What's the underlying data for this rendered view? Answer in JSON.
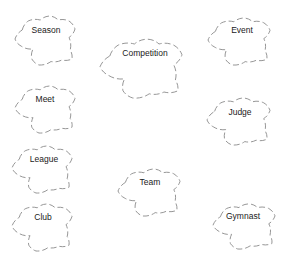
{
  "diagram": {
    "type": "concept-clouds",
    "stroke_color": "#8a8a8a",
    "text_color": "#1a1a1a",
    "nodes": [
      {
        "id": "season",
        "label": "Season",
        "x": 15,
        "y": 15,
        "w": 60,
        "h": 50,
        "tx": 46,
        "ty": 30
      },
      {
        "id": "competition",
        "label": "Competition",
        "x": 100,
        "y": 38,
        "w": 82,
        "h": 60,
        "tx": 145,
        "ty": 53
      },
      {
        "id": "event",
        "label": "Event",
        "x": 208,
        "y": 17,
        "w": 62,
        "h": 48,
        "tx": 242,
        "ty": 30
      },
      {
        "id": "meet",
        "label": "Meet",
        "x": 15,
        "y": 85,
        "w": 60,
        "h": 48,
        "tx": 45,
        "ty": 99
      },
      {
        "id": "judge",
        "label": "Judge",
        "x": 207,
        "y": 97,
        "w": 63,
        "h": 48,
        "tx": 240,
        "ty": 112
      },
      {
        "id": "league",
        "label": "League",
        "x": 12,
        "y": 145,
        "w": 60,
        "h": 48,
        "tx": 44,
        "ty": 159
      },
      {
        "id": "team",
        "label": "Team",
        "x": 118,
        "y": 168,
        "w": 62,
        "h": 48,
        "tx": 150,
        "ty": 182
      },
      {
        "id": "club",
        "label": "Club",
        "x": 12,
        "y": 203,
        "w": 60,
        "h": 48,
        "tx": 43,
        "ty": 217
      },
      {
        "id": "gymnast",
        "label": "Gymnast",
        "x": 213,
        "y": 203,
        "w": 62,
        "h": 46,
        "tx": 243,
        "ty": 216
      }
    ]
  }
}
